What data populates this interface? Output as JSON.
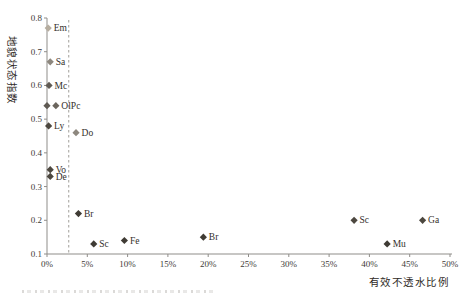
{
  "chart_data": {
    "type": "scatter",
    "title": "",
    "xlabel": "有效不透水比例",
    "ylabel": "地貌状态指数",
    "xlim": [
      0,
      50
    ],
    "ylim": [
      0.1,
      0.8
    ],
    "grid": false,
    "legend": false,
    "x_tick_values": [
      0,
      5,
      10,
      15,
      20,
      25,
      30,
      35,
      40,
      45,
      50
    ],
    "x_tick_labels": [
      "0%",
      "5%",
      "10%",
      "15%",
      "20%",
      "25%",
      "30%",
      "35%",
      "40%",
      "45%",
      "50%"
    ],
    "y_tick_values": [
      0.1,
      0.2,
      0.3,
      0.4,
      0.5,
      0.6,
      0.7,
      0.8
    ],
    "y_tick_labels": [
      "0.1",
      "0.2",
      "0.3",
      "0.4",
      "0.5",
      "0.6",
      "0.7",
      "0.8"
    ],
    "reference_line": {
      "type": "vertical-dashed",
      "x": 2.7
    },
    "points": [
      {
        "label": "Em",
        "x": 0.15,
        "y": 0.77,
        "color": "#b6ad9f"
      },
      {
        "label": "Sa",
        "x": 0.4,
        "y": 0.67,
        "color": "#8d877e"
      },
      {
        "label": "Mc",
        "x": 0.25,
        "y": 0.6,
        "color": "#5f5a53"
      },
      {
        "label": "",
        "x": 0.0,
        "y": 0.54,
        "color": "#5f5a53"
      },
      {
        "label": "OlPc",
        "x": 1.1,
        "y": 0.54,
        "color": "#6b655d"
      },
      {
        "label": "Ly",
        "x": 0.2,
        "y": 0.48,
        "color": "#4c473f"
      },
      {
        "label": "Do",
        "x": 3.6,
        "y": 0.46,
        "color": "#8d877e"
      },
      {
        "label": "Vo",
        "x": 0.4,
        "y": 0.35,
        "color": "#4c473f"
      },
      {
        "label": "De",
        "x": 0.4,
        "y": 0.33,
        "color": "#4c473f"
      },
      {
        "label": "Br",
        "x": 3.9,
        "y": 0.22,
        "color": "#3f3b34"
      },
      {
        "label": "Sc",
        "x": 5.8,
        "y": 0.13,
        "color": "#3f3b34"
      },
      {
        "label": "Fe",
        "x": 9.6,
        "y": 0.14,
        "color": "#3f3b34"
      },
      {
        "label": "Br",
        "x": 19.4,
        "y": 0.15,
        "color": "#3f3b34"
      },
      {
        "label": "Sc",
        "x": 38.1,
        "y": 0.2,
        "color": "#4c473f"
      },
      {
        "label": "Mu",
        "x": 42.2,
        "y": 0.13,
        "color": "#3f3b34"
      },
      {
        "label": "Ga",
        "x": 46.6,
        "y": 0.2,
        "color": "#4c473f"
      }
    ],
    "colors": {
      "axis": "#8f8d89",
      "tick_text": "#3d3a36",
      "point_label_text": "#34302b",
      "dashed_line": "#a19e99",
      "background": "#ffffff"
    }
  }
}
